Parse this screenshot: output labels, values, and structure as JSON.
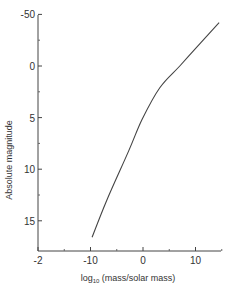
{
  "chart_data": {
    "type": "line",
    "title": "",
    "xlabel": "log10 (mass/solar mass)",
    "xlabel_parts": {
      "prefix": "log",
      "subscript": "10",
      "suffix": " (mass/solar mass)"
    },
    "ylabel": "Absolute magnitude",
    "xlim": [
      -2,
      1.6
    ],
    "ylim": [
      17.5,
      -5.0
    ],
    "y_inverted": true,
    "grid": false,
    "legend": null,
    "x_ticks": [
      {
        "value": -2,
        "label": "-2"
      },
      {
        "value": -1.0,
        "label": "-10"
      },
      {
        "value": 0,
        "label": "0"
      },
      {
        "value": 1.0,
        "label": "10"
      }
    ],
    "y_ticks": [
      {
        "value": -5.0,
        "label": "-50"
      },
      {
        "value": 0,
        "label": "0"
      },
      {
        "value": 5,
        "label": "5"
      },
      {
        "value": 10,
        "label": "10"
      },
      {
        "value": 15,
        "label": "15"
      }
    ],
    "series": [
      {
        "name": "mass-luminosity relation",
        "color": "#444444",
        "x": [
          -0.97,
          -0.69,
          -0.27,
          -0.02,
          0.32,
          0.7,
          1.09,
          1.45
        ],
        "y": [
          16.6,
          13.0,
          8.2,
          5.2,
          2.1,
          0.0,
          -2.2,
          -4.2
        ]
      }
    ]
  }
}
